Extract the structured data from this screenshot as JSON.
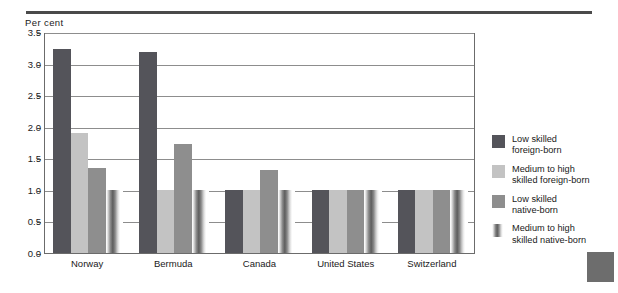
{
  "figure": {
    "top_rule": "horizontal-rule",
    "page_tab_color": "#6d6d6d"
  },
  "chart_data": {
    "type": "bar",
    "title": "",
    "subtitle": "",
    "xlabel": "",
    "ylabel": "Per cent",
    "ylim": [
      0.0,
      3.5
    ],
    "ytick_step": 0.5,
    "ytick_labels": [
      "0.0",
      "0.5",
      "1.0",
      "1.5",
      "2.0",
      "2.5",
      "3.0",
      "3.5"
    ],
    "grid": "horizontal",
    "legend_position": "right",
    "categories": [
      "Norway",
      "Bermuda",
      "Canada",
      "United States",
      "Switzerland"
    ],
    "series": [
      {
        "name": "Low skilled foreign-born",
        "label_line1": "Low skilled",
        "label_line2": "foreign-born",
        "color": "#54545a",
        "values": [
          3.23,
          3.18,
          1.0,
          1.0,
          1.0
        ]
      },
      {
        "name": "Medium to high skilled foreign-born",
        "label_line1": "Medium to high",
        "label_line2": "skilled foreign-born",
        "color": "#c3c3c3",
        "values": [
          1.9,
          1.0,
          1.0,
          1.0,
          1.0
        ]
      },
      {
        "name": "Low skilled native-born",
        "label_line1": "Low skilled",
        "label_line2": "native-born",
        "color": "#8e8e8e",
        "values": [
          1.35,
          1.72,
          1.31,
          1.0,
          1.0
        ]
      },
      {
        "name": "Medium to high skilled native-born",
        "label_line1": "Medium to high",
        "label_line2": "skilled native-born",
        "color": "striped-gradient",
        "values": [
          1.0,
          1.0,
          1.0,
          1.0,
          1.0
        ]
      }
    ]
  }
}
